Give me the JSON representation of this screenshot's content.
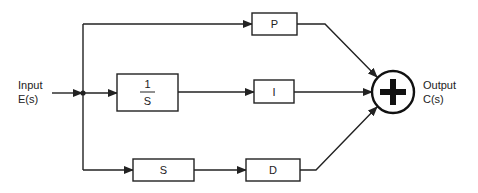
{
  "diagram": {
    "type": "PID controller block diagram",
    "input": {
      "line1": "Input",
      "line2": "E(s)"
    },
    "output": {
      "line1": "Output",
      "line2": "C(s)"
    },
    "blocks": {
      "p": "P",
      "integrator_num": "1",
      "integrator_den": "S",
      "i": "I",
      "s": "S",
      "d": "D"
    },
    "summing_junction": {
      "symbol": "+"
    },
    "paths": [
      {
        "name": "proportional",
        "sequence": [
          "P"
        ]
      },
      {
        "name": "integral",
        "sequence": [
          "1/S",
          "I"
        ]
      },
      {
        "name": "derivative",
        "sequence": [
          "S",
          "D"
        ]
      }
    ]
  }
}
